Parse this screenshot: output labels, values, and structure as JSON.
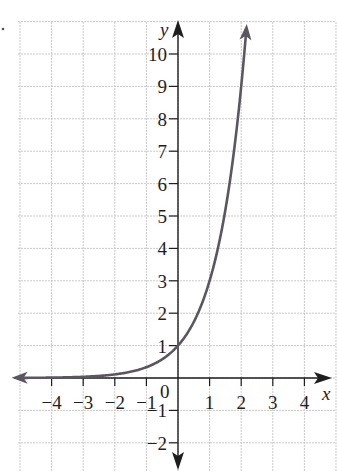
{
  "chart_data": {
    "type": "line",
    "title": "",
    "function": "y = 3^x",
    "xlabel": "x",
    "ylabel": "y",
    "xlim": [
      -5,
      5
    ],
    "ylim": [
      -3,
      11
    ],
    "grid": true,
    "x_ticks": [
      -4,
      -3,
      -2,
      -1,
      0,
      1,
      2,
      3,
      4
    ],
    "y_ticks": [
      -2,
      -1,
      1,
      2,
      3,
      4,
      5,
      6,
      7,
      8,
      9,
      10
    ],
    "x_tick_labels": [
      "−4",
      "−3",
      "−2",
      "−1",
      "0",
      "1",
      "2",
      "3",
      "4"
    ],
    "y_tick_labels": [
      "−2",
      "−1",
      "1",
      "2",
      "3",
      "4",
      "5",
      "6",
      "7",
      "8",
      "9",
      "10"
    ],
    "series": [
      {
        "name": "curve",
        "color": "#5b5660",
        "x": [
          -5,
          -4,
          -3,
          -2,
          -1,
          0,
          0.5,
          1,
          1.5,
          2,
          2.2
        ],
        "y": [
          0.004,
          0.012,
          0.037,
          0.111,
          0.333,
          1,
          1.732,
          3,
          5.196,
          9,
          11.2
        ]
      }
    ],
    "annotations": [
      "arrows on both ends of curve",
      "arrows on axes"
    ]
  },
  "labels": {
    "x_axis": "x",
    "y_axis": "y",
    "origin": "0"
  }
}
